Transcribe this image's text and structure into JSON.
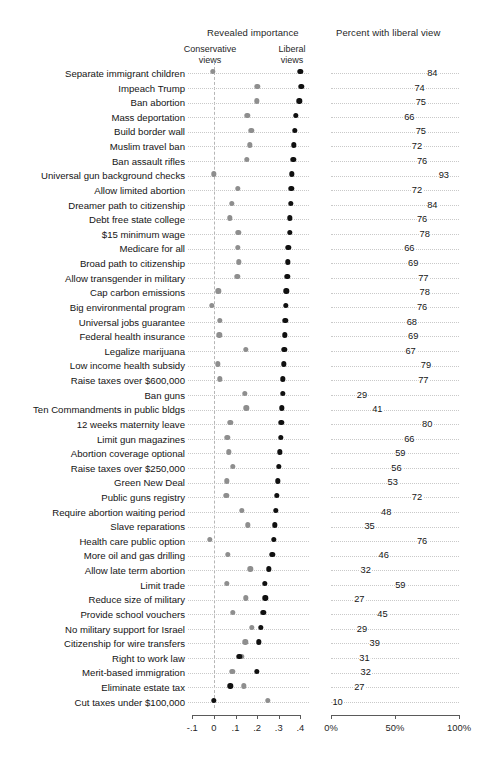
{
  "figure": {
    "left_panel_title": "Revealed importance",
    "right_panel_title": "Percent with liberal view",
    "conservative_annotation": "Conservative\nviews",
    "conservative_annotation_line1": "Conservative",
    "conservative_annotation_line2": "views",
    "liberal_annotation_line1": "Liberal",
    "liberal_annotation_line2": "views",
    "colors": {
      "conservative_dot": "#8e8e8e",
      "liberal_dot": "#101010",
      "dotted_guide": "#c9c9c9",
      "axis": "#5a5a5a",
      "background": "#ffffff"
    }
  },
  "chart_data": {
    "type": "scatter",
    "title": "Revealed importance",
    "subtitle": "Percent with liberal view",
    "xlabel": "",
    "ylabel": "",
    "grid": false,
    "legend": [
      "Conservative views",
      "Liberal views"
    ],
    "legend_position": "top",
    "left_axis": {
      "ticks": [
        -0.1,
        0,
        0.1,
        0.2,
        0.3,
        0.4
      ],
      "tick_labels": [
        "-.1",
        "0",
        ".1",
        ".2",
        ".3",
        ".4"
      ],
      "xlim": [
        -0.12,
        0.44
      ]
    },
    "right_axis": {
      "ticks": [
        0,
        50,
        100
      ],
      "tick_labels": [
        "0%",
        "50%",
        "100%"
      ],
      "xlim": [
        0,
        100
      ]
    },
    "series": [
      {
        "name": "Conservative views",
        "color": "#8e8e8e"
      },
      {
        "name": "Liberal views",
        "color": "#101010"
      }
    ],
    "categories": [
      "Separate immigrant children",
      "Impeach Trump",
      "Ban abortion",
      "Mass deportation",
      "Build border wall",
      "Muslim travel ban",
      "Ban assault rifles",
      "Universal gun background checks",
      "Allow limited abortion",
      "Dreamer path to citizenship",
      "Debt free state college",
      "$15 minimum wage",
      "Medicare for all",
      "Broad path to citizenship",
      "Allow transgender in military",
      "Cap carbon emissions",
      "Big environmental program",
      "Universal jobs guarantee",
      "Federal health insurance",
      "Legalize marijuana",
      "Low income health subsidy",
      "Raise taxes over $600,000",
      "Ban guns",
      "Ten Commandments in public bldgs",
      "12 weeks maternity leave",
      "Limit gun magazines",
      "Abortion coverage optional",
      "Raise taxes over $250,000",
      "Green New Deal",
      "Public guns registry",
      "Require abortion waiting period",
      "Slave reparations",
      "Health care public option",
      "More oil and gas drilling",
      "Allow late term abortion",
      "Limit trade",
      "Reduce size of military",
      "Provide school vouchers",
      "No military support for Israel",
      "Citizenship for wire transfers",
      "Right to work law",
      "Merit-based immigration",
      "Eliminate estate tax",
      "Cut taxes under $100,000"
    ],
    "rows": [
      {
        "label": "Separate immigrant children",
        "conservative": -0.005,
        "liberal": 0.4,
        "percent": 84
      },
      {
        "label": "Impeach Trump",
        "conservative": 0.2,
        "liberal": 0.405,
        "percent": 74
      },
      {
        "label": "Ban abortion",
        "conservative": 0.198,
        "liberal": 0.395,
        "percent": 75
      },
      {
        "label": "Mass deportation",
        "conservative": 0.155,
        "liberal": 0.38,
        "percent": 66
      },
      {
        "label": "Build border wall",
        "conservative": 0.173,
        "liberal": 0.375,
        "percent": 75
      },
      {
        "label": "Muslim travel ban",
        "conservative": 0.165,
        "liberal": 0.37,
        "percent": 72
      },
      {
        "label": "Ban assault rifles",
        "conservative": 0.152,
        "liberal": 0.368,
        "percent": 76
      },
      {
        "label": "Universal gun background checks",
        "conservative": 0.0,
        "liberal": 0.36,
        "percent": 93
      },
      {
        "label": "Allow limited abortion",
        "conservative": 0.11,
        "liberal": 0.358,
        "percent": 72
      },
      {
        "label": "Dreamer path to citizenship",
        "conservative": 0.083,
        "liberal": 0.355,
        "percent": 84
      },
      {
        "label": "Debt free state college",
        "conservative": 0.073,
        "liberal": 0.352,
        "percent": 76
      },
      {
        "label": "$15 minimum wage",
        "conservative": 0.112,
        "liberal": 0.35,
        "percent": 78
      },
      {
        "label": "Medicare for all",
        "conservative": 0.11,
        "liberal": 0.345,
        "percent": 66
      },
      {
        "label": "Broad path to citizenship",
        "conservative": 0.115,
        "liberal": 0.343,
        "percent": 69
      },
      {
        "label": "Allow transgender in military",
        "conservative": 0.108,
        "liberal": 0.34,
        "percent": 77
      },
      {
        "label": "Cap carbon emissions",
        "conservative": 0.02,
        "liberal": 0.335,
        "percent": 78
      },
      {
        "label": "Big environmental program",
        "conservative": -0.01,
        "liberal": 0.333,
        "percent": 76
      },
      {
        "label": "Universal jobs guarantee",
        "conservative": 0.028,
        "liberal": 0.33,
        "percent": 68
      },
      {
        "label": "Federal health insurance",
        "conservative": 0.025,
        "liberal": 0.328,
        "percent": 69
      },
      {
        "label": "Legalize marijuana",
        "conservative": 0.148,
        "liberal": 0.325,
        "percent": 67
      },
      {
        "label": "Low income health subsidy",
        "conservative": 0.018,
        "liberal": 0.322,
        "percent": 79
      },
      {
        "label": "Raise taxes over $600,000",
        "conservative": 0.028,
        "liberal": 0.32,
        "percent": 77
      },
      {
        "label": "Ban guns",
        "conservative": 0.143,
        "liberal": 0.318,
        "percent": 29
      },
      {
        "label": "Ten Commandments in public bldgs",
        "conservative": 0.15,
        "liberal": 0.315,
        "percent": 41
      },
      {
        "label": "12 weeks maternity leave",
        "conservative": 0.075,
        "liberal": 0.312,
        "percent": 80
      },
      {
        "label": "Limit gun magazines",
        "conservative": 0.062,
        "liberal": 0.31,
        "percent": 66
      },
      {
        "label": "Abortion coverage optional",
        "conservative": 0.07,
        "liberal": 0.305,
        "percent": 59
      },
      {
        "label": "Raise taxes over $250,000",
        "conservative": 0.088,
        "liberal": 0.3,
        "percent": 56
      },
      {
        "label": "Green New Deal",
        "conservative": 0.06,
        "liberal": 0.297,
        "percent": 53
      },
      {
        "label": "Public guns registry",
        "conservative": 0.058,
        "liberal": 0.292,
        "percent": 72
      },
      {
        "label": "Require abortion waiting period",
        "conservative": 0.128,
        "liberal": 0.285,
        "percent": 48
      },
      {
        "label": "Slave reparations",
        "conservative": 0.158,
        "liberal": 0.282,
        "percent": 35
      },
      {
        "label": "Health care public option",
        "conservative": -0.018,
        "liberal": 0.278,
        "percent": 76
      },
      {
        "label": "More oil and gas drilling",
        "conservative": 0.065,
        "liberal": 0.27,
        "percent": 46
      },
      {
        "label": "Allow late term abortion",
        "conservative": 0.168,
        "liberal": 0.253,
        "percent": 32
      },
      {
        "label": "Limit trade",
        "conservative": 0.06,
        "liberal": 0.235,
        "percent": 59
      },
      {
        "label": "Reduce size of military",
        "conservative": 0.148,
        "liberal": 0.237,
        "percent": 27
      },
      {
        "label": "Provide school vouchers",
        "conservative": 0.088,
        "liberal": 0.228,
        "percent": 45
      },
      {
        "label": "No military support for Israel",
        "conservative": 0.175,
        "liberal": 0.218,
        "percent": 29
      },
      {
        "label": "Citizenship for wire transfers",
        "conservative": 0.145,
        "liberal": 0.208,
        "percent": 39
      },
      {
        "label": "Right to work law",
        "conservative": 0.128,
        "liberal": 0.118,
        "percent": 31
      },
      {
        "label": "Merit-based immigration",
        "conservative": 0.085,
        "liberal": 0.198,
        "percent": 32
      },
      {
        "label": "Eliminate estate tax",
        "conservative": 0.138,
        "liberal": 0.075,
        "percent": 27
      },
      {
        "label": "Cut taxes under $100,000",
        "conservative": 0.25,
        "liberal": 0.0,
        "percent": 10
      }
    ]
  }
}
